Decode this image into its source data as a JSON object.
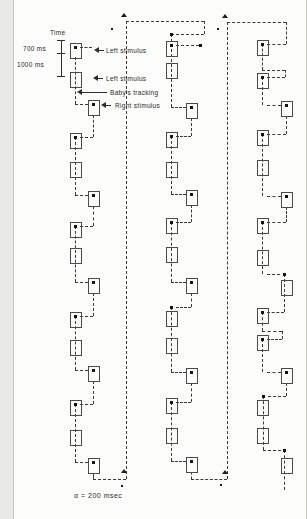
{
  "figure": {
    "labels": {
      "time_axis_title": "Time",
      "tick_700": "700 ms",
      "tick_1000": "1000 ms",
      "left_stimulus_1": "Left stimulus",
      "left_stimulus_2": "Left stimulus",
      "babys_tracking": "Baby's tracking",
      "right_stimulus": "Right stimulus",
      "footnote": "α = 200 msec"
    },
    "colors": {
      "background": "#fcfcfa",
      "ink": "#3a3a3a",
      "box_border": "#4a4a4a",
      "dot": "#141414"
    },
    "diagram": {
      "time_axis": {
        "x": 47,
        "y1": 40,
        "y2": 76,
        "ticks_y": [
          40,
          53,
          76
        ],
        "tick_x1": 43,
        "tick_x2": 51
      },
      "callout_arrows": [
        [
          80,
          90,
          50
        ],
        [
          79,
          89,
          78
        ],
        [
          63,
          93,
          92
        ],
        [
          87,
          97,
          105
        ]
      ],
      "boxes": [
        [
          56,
          43
        ],
        [
          56,
          72
        ],
        [
          56,
          133
        ],
        [
          56,
          162
        ],
        [
          56,
          222
        ],
        [
          56,
          248
        ],
        [
          56,
          312
        ],
        [
          56,
          340
        ],
        [
          56,
          400
        ],
        [
          56,
          430
        ],
        [
          74,
          100
        ],
        [
          74,
          191
        ],
        [
          74,
          278
        ],
        [
          74,
          366
        ],
        [
          74,
          458
        ],
        [
          152,
          41
        ],
        [
          152,
          63
        ],
        [
          152,
          132
        ],
        [
          152,
          162
        ],
        [
          152,
          218
        ],
        [
          152,
          247
        ],
        [
          152,
          311
        ],
        [
          152,
          338
        ],
        [
          152,
          398
        ],
        [
          152,
          428
        ],
        [
          172,
          103
        ],
        [
          172,
          190
        ],
        [
          172,
          278
        ],
        [
          172,
          368
        ],
        [
          172,
          457
        ],
        [
          243,
          40
        ],
        [
          243,
          73
        ],
        [
          243,
          130
        ],
        [
          243,
          160
        ],
        [
          243,
          218
        ],
        [
          243,
          250
        ],
        [
          243,
          308
        ],
        [
          243,
          335
        ],
        [
          243,
          400
        ],
        [
          243,
          428
        ],
        [
          267,
          101
        ],
        [
          267,
          192
        ],
        [
          267,
          280
        ],
        [
          267,
          368
        ],
        [
          267,
          458
        ]
      ],
      "segments_v": [
        [
          61,
          57,
          104
        ],
        [
          79,
          115,
          137
        ],
        [
          61,
          137,
          195
        ],
        [
          79,
          206,
          226
        ],
        [
          61,
          226,
          282
        ],
        [
          79,
          293,
          316
        ],
        [
          61,
          316,
          370
        ],
        [
          79,
          381,
          404
        ],
        [
          61,
          404,
          462
        ],
        [
          79,
          473,
          479
        ],
        [
          112,
          21,
          479
        ],
        [
          190,
          21,
          34
        ],
        [
          157,
          34,
          107
        ],
        [
          177,
          118,
          136
        ],
        [
          157,
          136,
          194
        ],
        [
          177,
          205,
          222
        ],
        [
          157,
          222,
          282
        ],
        [
          177,
          293,
          307
        ],
        [
          157,
          307,
          372
        ],
        [
          177,
          383,
          402
        ],
        [
          157,
          402,
          461
        ],
        [
          177,
          472,
          479
        ],
        [
          213,
          22,
          479
        ],
        [
          272,
          22,
          44
        ],
        [
          248,
          44,
          70
        ],
        [
          271,
          70,
          77
        ],
        [
          248,
          77,
          105
        ],
        [
          272,
          116,
          134
        ],
        [
          248,
          134,
          196
        ],
        [
          272,
          207,
          222
        ],
        [
          248,
          222,
          274
        ],
        [
          270,
          274,
          312
        ],
        [
          248,
          312,
          331
        ],
        [
          268,
          331,
          339
        ],
        [
          248,
          339,
          372
        ],
        [
          272,
          383,
          396
        ],
        [
          249,
          396,
          450
        ],
        [
          270,
          450,
          490
        ]
      ],
      "segments_h": [
        [
          47,
          66,
          78
        ],
        [
          104,
          61,
          74
        ],
        [
          137,
          66,
          79
        ],
        [
          195,
          61,
          74
        ],
        [
          226,
          66,
          79
        ],
        [
          282,
          61,
          74
        ],
        [
          316,
          66,
          79
        ],
        [
          370,
          61,
          74
        ],
        [
          404,
          66,
          79
        ],
        [
          462,
          61,
          74
        ],
        [
          479,
          79,
          112
        ],
        [
          21,
          112,
          190
        ],
        [
          34,
          157,
          190
        ],
        [
          45,
          162,
          185
        ],
        [
          107,
          157,
          172
        ],
        [
          136,
          162,
          177
        ],
        [
          194,
          157,
          172
        ],
        [
          222,
          162,
          177
        ],
        [
          282,
          157,
          172
        ],
        [
          307,
          162,
          177
        ],
        [
          372,
          157,
          172
        ],
        [
          402,
          162,
          177
        ],
        [
          461,
          157,
          172
        ],
        [
          479,
          177,
          213
        ],
        [
          22,
          213,
          272
        ],
        [
          44,
          253,
          272
        ],
        [
          70,
          248,
          271
        ],
        [
          77,
          253,
          271
        ],
        [
          105,
          253,
          267
        ],
        [
          134,
          253,
          272
        ],
        [
          196,
          253,
          267
        ],
        [
          222,
          253,
          272
        ],
        [
          274,
          253,
          266
        ],
        [
          312,
          253,
          270
        ],
        [
          331,
          248,
          268
        ],
        [
          339,
          253,
          268
        ],
        [
          372,
          253,
          267
        ],
        [
          396,
          254,
          272
        ],
        [
          450,
          249,
          267
        ]
      ],
      "dots": [
        [
          61,
          47
        ],
        [
          79,
          104
        ],
        [
          61,
          137
        ],
        [
          79,
          195
        ],
        [
          61,
          226
        ],
        [
          79,
          282
        ],
        [
          61,
          316
        ],
        [
          79,
          370
        ],
        [
          61,
          404
        ],
        [
          79,
          462
        ],
        [
          157,
          34
        ],
        [
          157,
          45
        ],
        [
          186,
          45
        ],
        [
          177,
          107
        ],
        [
          157,
          136
        ],
        [
          177,
          194
        ],
        [
          157,
          222
        ],
        [
          177,
          282
        ],
        [
          157,
          307
        ],
        [
          177,
          372
        ],
        [
          157,
          402
        ],
        [
          177,
          461
        ],
        [
          248,
          44
        ],
        [
          248,
          77
        ],
        [
          272,
          105
        ],
        [
          248,
          134
        ],
        [
          272,
          196
        ],
        [
          248,
          222
        ],
        [
          270,
          274
        ],
        [
          248,
          312
        ],
        [
          248,
          339
        ],
        [
          272,
          372
        ],
        [
          249,
          396
        ],
        [
          270,
          450
        ]
      ],
      "up_arrows": [
        [
          110,
          13
        ],
        [
          211,
          14
        ],
        [
          110,
          469
        ],
        [
          211,
          470
        ]
      ],
      "small_marks": [
        [
          97,
          28
        ],
        [
          203,
          28
        ],
        [
          107,
          485
        ],
        [
          206,
          484
        ]
      ]
    }
  }
}
